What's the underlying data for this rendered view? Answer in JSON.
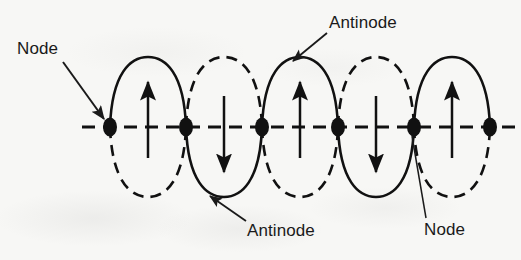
{
  "figure": {
    "background_color": "#f7f7f5",
    "ink_color": "#1a1a1a"
  },
  "axis": {
    "name": "equilibrium-axis",
    "style": "dashed",
    "y": 127,
    "x_start": 82,
    "x_end": 515
  },
  "labels": [
    {
      "id": "node-top",
      "text": "Node",
      "x": 17,
      "y": 40,
      "leader": {
        "from_x": 63,
        "from_y": 62,
        "to_x": 106,
        "to_y": 120,
        "head": "arrow"
      }
    },
    {
      "id": "antinode-top",
      "text": "Antinode",
      "x": 329,
      "y": 14,
      "leader": {
        "from_x": 327,
        "from_y": 33,
        "to_x": 292,
        "to_y": 62,
        "head": "arrow"
      }
    },
    {
      "id": "antinode-bottom",
      "text": "Antinode",
      "x": 247,
      "y": 222,
      "leader": {
        "from_x": 245,
        "from_y": 222,
        "to_x": 208,
        "to_y": 196,
        "head": "arrow"
      }
    },
    {
      "id": "node-bottom",
      "text": "Node",
      "x": 424,
      "y": 221,
      "leader": {
        "from_x": 424,
        "from_y": 219,
        "to_x": 414,
        "to_y": 136,
        "head": "none"
      }
    }
  ],
  "nodes": [
    {
      "index": 1,
      "x": 110,
      "y": 127
    },
    {
      "index": 2,
      "x": 186,
      "y": 127
    },
    {
      "index": 3,
      "x": 262,
      "y": 127
    },
    {
      "index": 4,
      "x": 338,
      "y": 127
    },
    {
      "index": 5,
      "x": 414,
      "y": 127
    },
    {
      "index": 6,
      "x": 490,
      "y": 127
    }
  ],
  "node_marker": {
    "shape": "filled-ellipse",
    "rx": 7,
    "ry": 9,
    "color": "#111111"
  },
  "loops": [
    {
      "index": 1,
      "x_left": 110,
      "x_right": 186,
      "amplitude": 70,
      "top_style": "solid",
      "bottom_style": "dashed",
      "arrow_direction": "up",
      "arrow_x": 148,
      "antinode_x": 148
    },
    {
      "index": 2,
      "x_left": 186,
      "x_right": 262,
      "amplitude": 70,
      "top_style": "dashed",
      "bottom_style": "solid",
      "arrow_direction": "down",
      "arrow_x": 224,
      "antinode_x": 224
    },
    {
      "index": 3,
      "x_left": 262,
      "x_right": 338,
      "amplitude": 70,
      "top_style": "solid",
      "bottom_style": "dashed",
      "arrow_direction": "up",
      "arrow_x": 300,
      "antinode_x": 300
    },
    {
      "index": 4,
      "x_left": 338,
      "x_right": 414,
      "amplitude": 70,
      "top_style": "dashed",
      "bottom_style": "solid",
      "arrow_direction": "down",
      "arrow_x": 376,
      "antinode_x": 376
    },
    {
      "index": 5,
      "x_left": 414,
      "x_right": 490,
      "amplitude": 70,
      "top_style": "solid",
      "bottom_style": "dashed",
      "arrow_direction": "up",
      "arrow_x": 452,
      "antinode_x": 452
    }
  ],
  "arrows": {
    "name": "displacement-arrows",
    "length": 62,
    "color": "#111111",
    "count": 5
  }
}
